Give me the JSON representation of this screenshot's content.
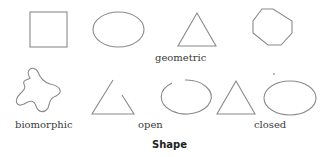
{
  "diagram": {
    "title": "Shape",
    "rows": [
      {
        "label": "geometric",
        "shapes": [
          "square",
          "ellipse",
          "triangle",
          "octagon"
        ]
      }
    ],
    "groups": [
      {
        "label": "biomorphic",
        "shapes": [
          "blob"
        ]
      },
      {
        "label": "open",
        "shapes": [
          "open-triangle",
          "open-ellipse"
        ]
      },
      {
        "label": "closed",
        "shapes": [
          "triangle",
          "ellipse"
        ]
      }
    ],
    "stroke_color": "#8a8a8a"
  }
}
